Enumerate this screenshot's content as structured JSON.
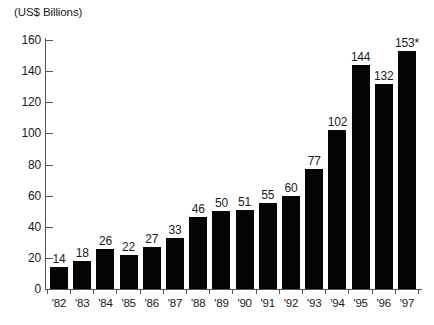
{
  "chart_data": {
    "type": "bar",
    "title": "",
    "subtitle": "",
    "xlabel": "",
    "ylabel": "(US$ Billions)",
    "unit_caption": "(US$ Billions)",
    "categories": [
      "'82",
      "'83",
      "'84",
      "'85",
      "'86",
      "'87",
      "'88",
      "'89",
      "'90",
      "'91",
      "'92",
      "'93",
      "'94",
      "'95",
      "'96",
      "'97"
    ],
    "values": [
      14,
      18,
      26,
      22,
      27,
      33,
      46,
      50,
      51,
      55,
      60,
      77,
      102,
      144,
      132,
      153
    ],
    "value_labels": [
      "14",
      "18",
      "26",
      "22",
      "27",
      "33",
      "46",
      "50",
      "51",
      "55",
      "60",
      "77",
      "102",
      "144",
      "132",
      "153*"
    ],
    "ylim": [
      0,
      160
    ],
    "yticks": [
      0,
      20,
      40,
      60,
      80,
      100,
      120,
      140,
      160
    ],
    "ytick_labels": [
      "0",
      "20",
      "40",
      "60",
      "80",
      "100",
      "120",
      "140",
      "160"
    ],
    "grid": false,
    "legend": null,
    "bar_color": "#050505",
    "axis_color": "#555555",
    "annotations": [
      "*"
    ]
  }
}
